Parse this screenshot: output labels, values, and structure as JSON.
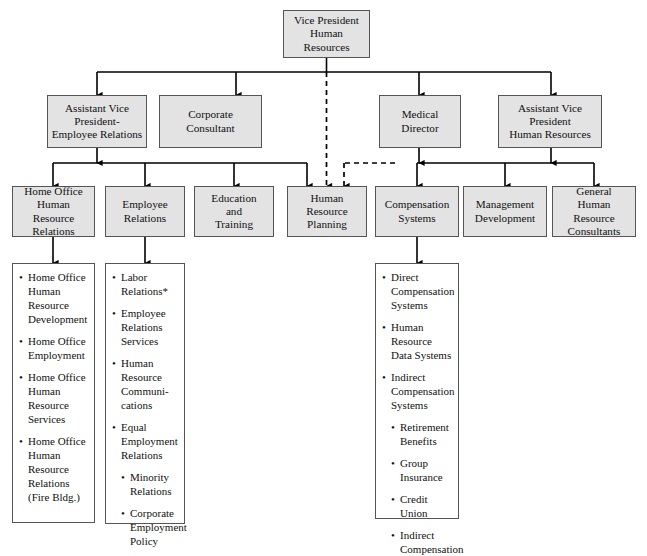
{
  "chart_data": {
    "type": "diagram",
    "diagram_kind": "organizational-hierarchy",
    "levels": 4,
    "colors": {
      "node_fill": "#e3e3e3",
      "node_border": "#555555",
      "list_fill": "#ffffff",
      "line": "#000000",
      "page_background": "#ffffff"
    },
    "link_styles": {
      "solid": "direct reporting line",
      "dashed": "dotted / indirect reporting line"
    }
  },
  "root": {
    "id": "vp-human-resources",
    "label": "Vice President\nHuman Resources"
  },
  "level2": [
    {
      "id": "assistant-vp-employee-relations",
      "label": "Assistant Vice\nPresident-\nEmployee Relations"
    },
    {
      "id": "corporate-consultant",
      "label": "Corporate\nConsultant"
    },
    {
      "id": "medical-director",
      "label": "Medical\nDirector"
    },
    {
      "id": "assistant-vp-human-resources",
      "label": "Assistant Vice\nPresident\nHuman Resources"
    }
  ],
  "level3": [
    {
      "id": "home-office-human-resource-relations",
      "label": "Home Office\nHuman Resource\nRelations"
    },
    {
      "id": "employee-relations",
      "label": "Employee\nRelations"
    },
    {
      "id": "education-and-training",
      "label": "Education\nand\nTraining"
    },
    {
      "id": "human-resource-planning",
      "label": "Human\nResource\nPlanning"
    },
    {
      "id": "compensation-systems",
      "label": "Compensation\nSystems"
    },
    {
      "id": "management-development",
      "label": "Management\nDevelopment"
    },
    {
      "id": "general-human-resource-consultants",
      "label": "General\nHuman Resource\nConsultants"
    }
  ],
  "lists": {
    "home_office": [
      {
        "text": "Home Office\nHuman\nResource\nDevelopment",
        "level": 1
      },
      {
        "text": "Home Office\nEmployment",
        "level": 1
      },
      {
        "text": "Home Office\nHuman\nResource\nServices",
        "level": 1
      },
      {
        "text": "Home Office\nHuman\nResource\nRelations\n(Fire Bldg.)",
        "level": 1
      }
    ],
    "employee_relations": [
      {
        "text": "Labor\nRelations*",
        "level": 1
      },
      {
        "text": "Employee\nRelations\nServices",
        "level": 1
      },
      {
        "text": "Human\nResource\nCommuni-\ncations",
        "level": 1
      },
      {
        "text": "Equal\nEmployment\nRelations",
        "level": 1
      },
      {
        "text": "Minority\nRelations",
        "level": 2
      },
      {
        "text": "Corporate\nEmployment\nPolicy",
        "level": 2
      }
    ],
    "compensation_systems": [
      {
        "text": "Direct\nCompensation\nSystems",
        "level": 1
      },
      {
        "text": "Human\nResource\nData Systems",
        "level": 1
      },
      {
        "text": "Indirect\nCompensation\nSystems",
        "level": 1
      },
      {
        "text": "Retirement\nBenefits",
        "level": 2
      },
      {
        "text": "Group\nInsurance",
        "level": 2
      },
      {
        "text": "Credit Union",
        "level": 2
      },
      {
        "text": "Indirect\nCompensation",
        "level": 2
      }
    ]
  }
}
